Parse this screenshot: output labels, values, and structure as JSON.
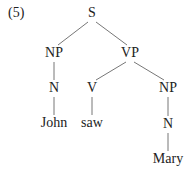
{
  "example_number": "(5)",
  "tree": {
    "nodes": [
      {
        "id": "S",
        "label": "S",
        "x": 92,
        "y": 5
      },
      {
        "id": "NP1",
        "label": "NP",
        "x": 54,
        "y": 45
      },
      {
        "id": "VP",
        "label": "VP",
        "x": 130,
        "y": 45
      },
      {
        "id": "N1",
        "label": "N",
        "x": 54,
        "y": 80
      },
      {
        "id": "John",
        "label": "John",
        "x": 54,
        "y": 115
      },
      {
        "id": "V",
        "label": "V",
        "x": 92,
        "y": 80
      },
      {
        "id": "saw",
        "label": "saw",
        "x": 92,
        "y": 115
      },
      {
        "id": "NP2",
        "label": "NP",
        "x": 168,
        "y": 80
      },
      {
        "id": "N2",
        "label": "N",
        "x": 168,
        "y": 116
      },
      {
        "id": "Mary",
        "label": "Mary",
        "x": 168,
        "y": 151
      }
    ],
    "edges": [
      [
        "S",
        "NP1"
      ],
      [
        "S",
        "VP"
      ],
      [
        "NP1",
        "N1"
      ],
      [
        "N1",
        "John"
      ],
      [
        "VP",
        "V"
      ],
      [
        "VP",
        "NP2"
      ],
      [
        "V",
        "saw"
      ],
      [
        "NP2",
        "N2"
      ],
      [
        "N2",
        "Mary"
      ]
    ]
  }
}
